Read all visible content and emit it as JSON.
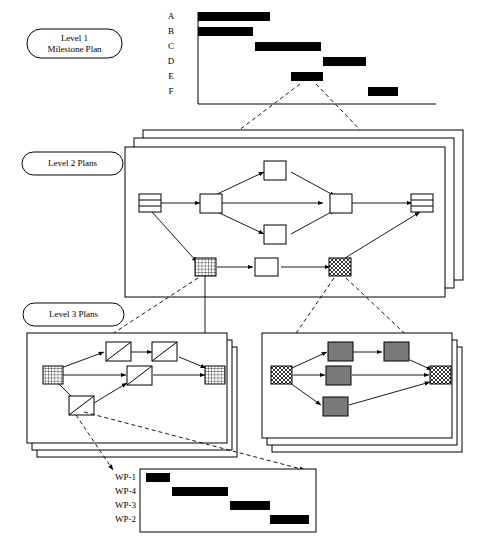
{
  "figure": {
    "background_color": "#ffffff",
    "line_color": "#000000",
    "bar_color": "#000000",
    "node_fill_gray": "#7a7a7a"
  },
  "level1": {
    "label_line1": "Level 1",
    "label_line2": "Milestone Plan",
    "gantt": {
      "row_labels": [
        "A",
        "B",
        "C",
        "D",
        "E",
        "F"
      ],
      "bars": [
        {
          "label": "A",
          "start": 0,
          "end": 72
        },
        {
          "label": "B",
          "start": 0,
          "end": 55
        },
        {
          "label": "C",
          "start": 57,
          "end": 123
        },
        {
          "label": "D",
          "start": 125,
          "end": 168
        },
        {
          "label": "E",
          "start": 93,
          "end": 125
        },
        {
          "label": "F",
          "start": 170,
          "end": 200
        }
      ]
    }
  },
  "level2": {
    "label": "Level 2 Plans",
    "sheet_count": 3,
    "nodes": [
      {
        "id": "n-start",
        "style": "striped"
      },
      {
        "id": "n-top",
        "style": "plain"
      },
      {
        "id": "n-mid-l",
        "style": "plain"
      },
      {
        "id": "n-mid-r",
        "style": "plain"
      },
      {
        "id": "n-low",
        "style": "plain"
      },
      {
        "id": "n-end",
        "style": "striped"
      },
      {
        "id": "n-grid",
        "style": "grid"
      },
      {
        "id": "n-plain2",
        "style": "plain"
      },
      {
        "id": "n-cross",
        "style": "crosshatch"
      }
    ]
  },
  "level3": {
    "label": "Level 3 Plans",
    "left": {
      "sheet_count": 3,
      "nodes": [
        {
          "id": "l-start",
          "style": "grid"
        },
        {
          "id": "l-t1",
          "style": "slash"
        },
        {
          "id": "l-t2",
          "style": "slash"
        },
        {
          "id": "l-m1",
          "style": "slash"
        },
        {
          "id": "l-b1",
          "style": "slash"
        },
        {
          "id": "l-end",
          "style": "grid"
        }
      ]
    },
    "right": {
      "sheet_count": 3,
      "nodes": [
        {
          "id": "r-start",
          "style": "crosshatch"
        },
        {
          "id": "r-t1",
          "style": "gray"
        },
        {
          "id": "r-t2",
          "style": "gray"
        },
        {
          "id": "r-m1",
          "style": "gray"
        },
        {
          "id": "r-b1",
          "style": "gray"
        },
        {
          "id": "r-end",
          "style": "crosshatch"
        }
      ]
    }
  },
  "workpackage_gantt": {
    "row_labels": [
      "WP-1",
      "WP-4",
      "WP-3",
      "WP-2"
    ],
    "bars": [
      {
        "label": "WP-1",
        "start": 0,
        "end": 24
      },
      {
        "label": "WP-4",
        "start": 26,
        "end": 82
      },
      {
        "label": "WP-3",
        "start": 84,
        "end": 124
      },
      {
        "label": "WP-2",
        "start": 124,
        "end": 163
      }
    ]
  }
}
